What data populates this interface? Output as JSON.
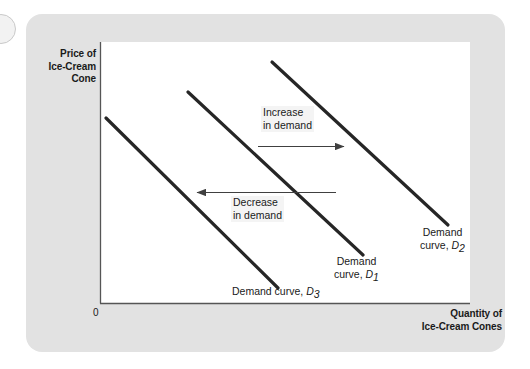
{
  "figure": {
    "axes": {
      "y_title": "Price of\nIce-Cream\nCone",
      "x_title": "Quantity of\nIce-Cream Cones",
      "origin": "0"
    },
    "annotations": [
      {
        "name": "increase",
        "text": "Increase\nin demand",
        "direction": "right"
      },
      {
        "name": "decrease",
        "text": "Decrease\nin demand",
        "direction": "left"
      }
    ],
    "curves": [
      {
        "id": "D3",
        "label": "Demand curve, ",
        "sub": "3",
        "x1": 106,
        "y1": 118,
        "x2": 278,
        "y2": 288
      },
      {
        "id": "D1",
        "label": "Demand\ncurve, ",
        "sub": "1",
        "x1": 188,
        "y1": 92,
        "x2": 363,
        "y2": 255
      },
      {
        "id": "D2",
        "label": "Demand\ncurve, ",
        "sub": "2",
        "x1": 272,
        "y1": 62,
        "x2": 448,
        "y2": 225
      }
    ],
    "colors": {
      "panel": "#e2e2e2",
      "plot": "#ffffff",
      "curve": "#262626",
      "axis": "#555555",
      "arrow": "#404040"
    }
  }
}
